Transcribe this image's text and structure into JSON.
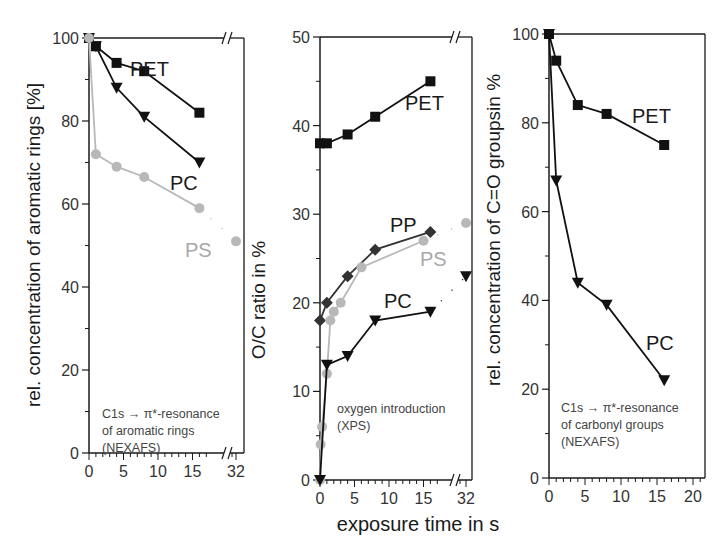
{
  "figure": {
    "xlabel": "exposure time in s"
  },
  "chart_data": [
    {
      "type": "line",
      "panel": "left",
      "ylabel": "rel. concentration of aromatic rings [%]",
      "xlabel": "",
      "annotation": [
        "C1s → π*-resonance",
        "of aromatic rings",
        "(NEXAFS)"
      ],
      "ylim": [
        0,
        100
      ],
      "yticks": [
        0,
        20,
        40,
        60,
        80,
        100
      ],
      "xticks": [
        0,
        5,
        10,
        15
      ],
      "x_break_tick": 32,
      "axis_break": true,
      "grid": false,
      "series": [
        {
          "name": "PET",
          "marker": "square",
          "color": "#111111",
          "x": [
            0,
            1,
            4,
            8,
            16
          ],
          "y": [
            100,
            98,
            94,
            92,
            82
          ],
          "label_pos": [
            130,
            76
          ]
        },
        {
          "name": "PC",
          "marker": "triangle-down",
          "color": "#111111",
          "x": [
            0,
            1,
            4,
            8,
            16
          ],
          "y": [
            100,
            98,
            88,
            81,
            70
          ],
          "label_pos": [
            170,
            190
          ]
        },
        {
          "name": "PS",
          "marker": "circle",
          "color": "#b8b8b8",
          "x": [
            0,
            1,
            4,
            8,
            16,
            32
          ],
          "y": [
            100,
            72,
            69,
            66.5,
            59,
            51
          ],
          "label_pos": [
            185,
            257
          ]
        }
      ]
    },
    {
      "type": "line",
      "panel": "middle",
      "ylabel": "O/C ratio in %",
      "xlabel": "exposure time in s",
      "annotation": [
        "oxygen introduction",
        "(XPS)"
      ],
      "ylim": [
        0,
        50
      ],
      "yticks": [
        0,
        10,
        20,
        30,
        40,
        50
      ],
      "xticks": [
        0,
        5,
        10,
        15
      ],
      "x_break_tick": 32,
      "axis_break": true,
      "grid": false,
      "series": [
        {
          "name": "PET",
          "marker": "square",
          "color": "#111111",
          "x": [
            0,
            1,
            4,
            8,
            16
          ],
          "y": [
            38,
            38,
            39,
            41,
            45
          ],
          "label_pos": [
            405,
            110
          ]
        },
        {
          "name": "PP",
          "marker": "diamond",
          "color": "#333333",
          "x": [
            0,
            1,
            4,
            8,
            16
          ],
          "y": [
            18,
            20,
            23,
            26,
            28
          ],
          "label_pos": [
            390,
            232
          ]
        },
        {
          "name": "PS",
          "marker": "circle",
          "color": "#b8b8b8",
          "x": [
            0,
            0.1,
            0.3,
            1,
            1.5,
            2,
            3,
            6,
            15,
            32
          ],
          "y": [
            0,
            4,
            6,
            12,
            18,
            19,
            20,
            24,
            27,
            29
          ],
          "label_pos": [
            420,
            266
          ]
        },
        {
          "name": "PC",
          "marker": "triangle-down",
          "color": "#111111",
          "x": [
            0,
            1,
            4,
            8,
            16,
            32
          ],
          "y": [
            0,
            13,
            14,
            18,
            19,
            23
          ],
          "label_pos": [
            384,
            308
          ]
        }
      ]
    },
    {
      "type": "line",
      "panel": "right",
      "ylabel": "rel. concentration of C=O groupsin %",
      "xlabel": "",
      "annotation": [
        "C1s → π*-resonance",
        "of carbonyl groups",
        "(NEXAFS)"
      ],
      "ylim": [
        0,
        100
      ],
      "yticks": [
        0,
        20,
        40,
        60,
        80,
        100
      ],
      "xticks": [
        0,
        5,
        10,
        15,
        20
      ],
      "axis_break": false,
      "grid": false,
      "series": [
        {
          "name": "PET",
          "marker": "square",
          "color": "#111111",
          "x": [
            0,
            1,
            4,
            8,
            16
          ],
          "y": [
            100,
            94,
            84,
            82,
            75
          ],
          "label_pos": [
            632,
            123
          ]
        },
        {
          "name": "PC",
          "marker": "triangle-down",
          "color": "#111111",
          "x": [
            0,
            1,
            4,
            8,
            16
          ],
          "y": [
            100,
            67,
            44,
            39,
            22
          ],
          "label_pos": [
            646,
            350
          ]
        }
      ]
    }
  ]
}
